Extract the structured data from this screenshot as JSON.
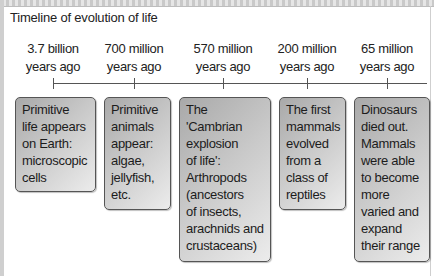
{
  "title": "Timeline of evolution of life",
  "timeline": [
    {
      "label_line1": "3.7 billion",
      "label_line2": "years ago",
      "description": [
        "Primitive",
        "life appears",
        "on Earth:",
        "microscopic",
        "cells"
      ]
    },
    {
      "label_line1": "700 million",
      "label_line2": "years ago",
      "description": [
        "Primitive",
        "animals",
        "appear:",
        "algae,",
        "jellyfish,",
        "etc."
      ]
    },
    {
      "label_line1": "570 million",
      "label_line2": "years ago",
      "description": [
        "The",
        "'Cambrian",
        "explosion",
        "of life':",
        "Arthropods",
        "(ancestors",
        "of insects,",
        "arachnids and",
        "crustaceans)"
      ]
    },
    {
      "label_line1": "200 million",
      "label_line2": "years ago",
      "description": [
        "The first",
        "mammals",
        "evolved",
        "from a",
        "class of",
        "reptiles"
      ]
    },
    {
      "label_line1": "65 million",
      "label_line2": "years ago",
      "description": [
        "Dinosaurs",
        "died out.",
        "Mammals",
        "were able",
        "to become",
        "more",
        "varied and",
        "expand",
        "their range"
      ]
    }
  ],
  "colors": {
    "box_dark": "#a9a9a9",
    "box_light": "#ececec",
    "line": "#555555",
    "text": "#222222"
  }
}
